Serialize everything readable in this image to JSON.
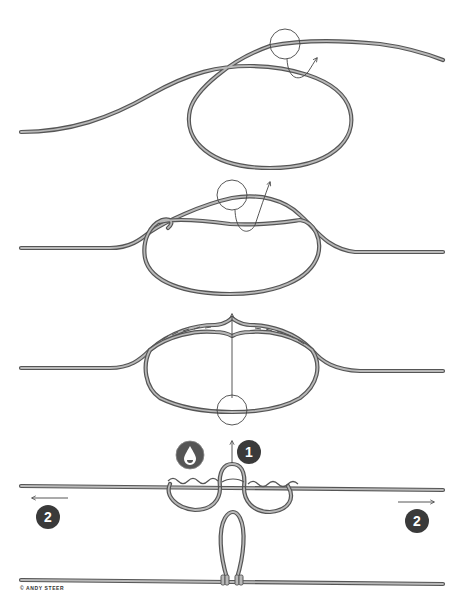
{
  "figure": {
    "steps": [
      {
        "index": 1,
        "description": "Form a loop in the line and pass tag end around, starting first wrap (circle marks crossing)"
      },
      {
        "index": 2,
        "description": "Continue wrapping the loop section around the standing line"
      },
      {
        "index": 3,
        "description": "Wraps complete on both sides; pull center of loop up through middle opening"
      },
      {
        "index": 4,
        "description": "Moisten, then pull loop up (1) and pull main line ends outward (2)"
      },
      {
        "index": 5,
        "description": "Finished dropper loop standing off the main line"
      }
    ],
    "badges": {
      "moisten": {
        "icon": "water-drop-icon",
        "color": "#555555"
      },
      "pull_loop": {
        "label": "1",
        "color": "#3a3a3a"
      },
      "pull_left": {
        "label": "2",
        "color": "#3a3a3a"
      },
      "pull_right": {
        "label": "2",
        "color": "#3a3a3a"
      }
    },
    "colors": {
      "rope_outline": "#555555",
      "rope_fill": "#b8b8b8",
      "guide": "#444444",
      "background": "#ffffff"
    }
  },
  "credit": "© ANDY STEER"
}
